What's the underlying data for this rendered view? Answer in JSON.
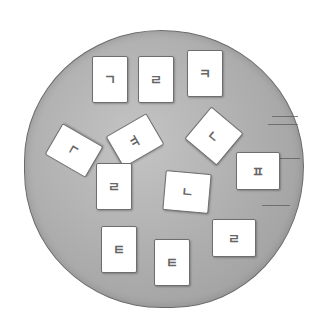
{
  "scene": {
    "description": "Cards with Korean consonant letters scattered on a round gray plate",
    "plate_color": "#acacac",
    "card_color": "#ffffff"
  },
  "cards": [
    {
      "letter": "ㄱ",
      "x": 92,
      "y": 56,
      "w": 34,
      "h": 45,
      "rot": 0
    },
    {
      "letter": "ㄹ",
      "x": 138,
      "y": 56,
      "w": 34,
      "h": 45,
      "rot": 0
    },
    {
      "letter": "ㅋ",
      "x": 187,
      "y": 50,
      "w": 34,
      "h": 45,
      "rot": 0
    },
    {
      "letter": "ㄱ",
      "x": 56,
      "y": 127,
      "w": 34,
      "h": 45,
      "rot": -60
    },
    {
      "letter": "ㅠ",
      "x": 117,
      "y": 117,
      "w": 34,
      "h": 45,
      "rot": 60
    },
    {
      "letter": "ㄴ",
      "x": 193,
      "y": 115,
      "w": 40,
      "h": 40,
      "rot": 40
    },
    {
      "letter": "ㅍ",
      "x": 236,
      "y": 152,
      "w": 42,
      "h": 36,
      "rot": 0
    },
    {
      "letter": "ㄹ",
      "x": 96,
      "y": 163,
      "w": 34,
      "h": 45,
      "rot": 0
    },
    {
      "letter": "ㄴ",
      "x": 164,
      "y": 172,
      "w": 44,
      "h": 38,
      "rot": 5
    },
    {
      "letter": "ㅌ",
      "x": 101,
      "y": 226,
      "w": 34,
      "h": 45,
      "rot": 0
    },
    {
      "letter": "ㅌ",
      "x": 154,
      "y": 239,
      "w": 34,
      "h": 45,
      "rot": 0
    },
    {
      "letter": "ㄹ",
      "x": 212,
      "y": 219,
      "w": 42,
      "h": 36,
      "rot": 0
    }
  ]
}
